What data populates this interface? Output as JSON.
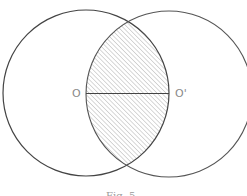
{
  "figure": {
    "type": "two-intersecting-circles",
    "shaded_region": "lens (intersection of both circles)",
    "hatch_style": "diagonal lines",
    "stroke_color": "#444444",
    "hatch_color": "#b0b0b0",
    "label_color": "#8a8a8a"
  },
  "labels": {
    "center_left": "O",
    "center_right": "O'"
  },
  "segment": {
    "from": "O",
    "to": "O'",
    "description": "segment joining the two centres"
  },
  "caption": "Fig. 5"
}
